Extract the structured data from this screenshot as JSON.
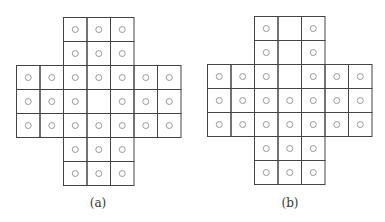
{
  "diagrams": [
    {
      "id": "a",
      "caption": "(a)",
      "origin": {
        "x": 16,
        "y": 17
      },
      "caption_pos": {
        "x": 98,
        "y": 196
      },
      "empty_cells": [
        [
          3,
          3
        ]
      ]
    },
    {
      "id": "b",
      "caption": "(b)",
      "origin": {
        "x": 207,
        "y": 16
      },
      "caption_pos": {
        "x": 290,
        "y": 196
      },
      "empty_cells": [
        [
          0,
          3
        ],
        [
          1,
          3
        ],
        [
          2,
          3
        ]
      ]
    }
  ],
  "grid": {
    "cols": 7,
    "rows": 7,
    "cell_w": 23.5,
    "cell_h": 24,
    "shape": "cross",
    "arm_cols": [
      2,
      3,
      4
    ],
    "arm_rows": [
      2,
      3,
      4
    ]
  },
  "style": {
    "line_color": "#444444",
    "peg_color": "#9a9a9a",
    "peg_radius": 3
  }
}
